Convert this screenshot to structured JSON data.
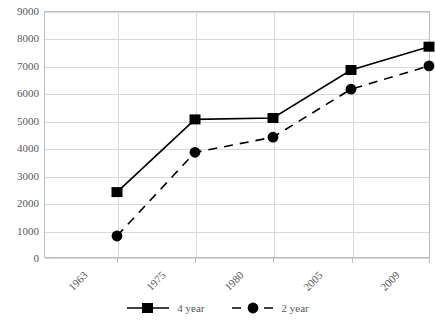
{
  "chart_data": {
    "type": "line",
    "title": "",
    "xlabel": "",
    "ylabel": "",
    "categories": [
      "1963",
      "1975",
      "1980",
      "2005",
      "2009"
    ],
    "ylim": [
      0,
      9000
    ],
    "ytick_step": 1000,
    "yticks": [
      "9000",
      "8000",
      "7000",
      "6000",
      "5000",
      "4000",
      "3000",
      "2000",
      "1000",
      "0"
    ],
    "grid": "horizontal-and-vertical",
    "legend_position": "bottom-center",
    "series": [
      {
        "name": "4 year",
        "values": [
          2400,
          5050,
          5100,
          6850,
          7700
        ],
        "line_style": "solid",
        "marker": "square",
        "color": "#000000"
      },
      {
        "name": "2 year",
        "values": [
          800,
          3850,
          4400,
          6150,
          7000
        ],
        "line_style": "dashed",
        "marker": "circle",
        "color": "#000000"
      }
    ]
  },
  "axis": {
    "y_tick_labels": [
      "9000",
      "8000",
      "7000",
      "6000",
      "5000",
      "4000",
      "3000",
      "2000",
      "1000",
      "0"
    ],
    "x_tick_labels": [
      "1963",
      "1975",
      "1980",
      "2005",
      "2009"
    ]
  },
  "legend": {
    "entries": [
      {
        "label": "4 year",
        "marker": "square-marker",
        "line": "solid-line"
      },
      {
        "label": "2 year",
        "marker": "circle-marker",
        "line": "dashed-line"
      }
    ]
  },
  "title_remnant": "",
  "colors": {
    "axis": "#bfbfbf",
    "gridline": "#d9d9d9",
    "text": "#595959",
    "series": "#000000",
    "background": "#ffffff"
  }
}
